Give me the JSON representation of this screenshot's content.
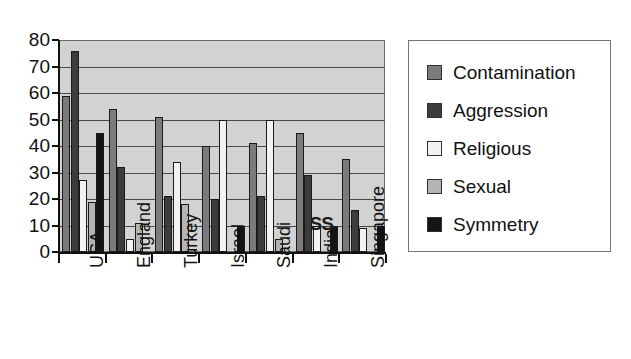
{
  "chart_data": {
    "type": "bar",
    "title": "",
    "xlabel": "",
    "ylabel": "",
    "ylim": [
      0,
      80
    ],
    "ytick_step": 10,
    "yticks": [
      80,
      70,
      60,
      50,
      40,
      30,
      20,
      10,
      0
    ],
    "grid": true,
    "legend_position": "right",
    "categories": [
      "USA",
      "England",
      "Turkey",
      "Israel",
      "Saudi",
      "India",
      "Singapore"
    ],
    "series": [
      {
        "name": "Contamination",
        "color": "#7b7b7b",
        "values": [
          59,
          54,
          51,
          40,
          41,
          45,
          35
        ]
      },
      {
        "name": "Aggression",
        "color": "#3c3c3c",
        "values": [
          76,
          32,
          21,
          20,
          21,
          29,
          16
        ]
      },
      {
        "name": "Religious",
        "color": "#f2f2f2",
        "values": [
          27,
          5,
          34,
          50,
          50,
          10,
          9
        ]
      },
      {
        "name": "Sexual",
        "color": "#b4b4b4",
        "values": [
          19,
          11,
          18,
          0,
          5,
          0,
          0
        ]
      },
      {
        "name": "Symmetry",
        "color": "#151515",
        "values": [
          45,
          0,
          0,
          10,
          0,
          10,
          10
        ]
      }
    ],
    "annotations": [
      {
        "text": "SS",
        "category": "India",
        "value": 13
      }
    ],
    "plot_background": "#d2d2d2",
    "axis_color": "#111111"
  }
}
